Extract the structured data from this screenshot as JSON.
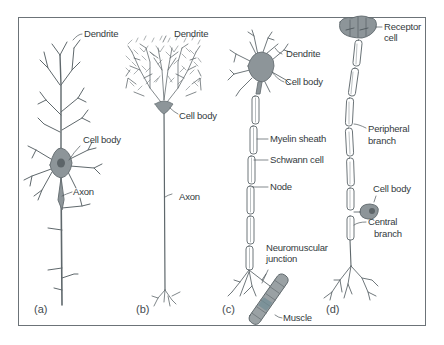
{
  "figure": {
    "panels": [
      {
        "id": "a",
        "tag": "(a)",
        "labels": {
          "dendrite": "Dendrite",
          "cell_body": "Cell body",
          "axon": "Axon"
        }
      },
      {
        "id": "b",
        "tag": "(b)",
        "labels": {
          "dendrite": "Dendrite",
          "cell_body": "Cell body",
          "axon": "Axon"
        }
      },
      {
        "id": "c",
        "tag": "(c)",
        "labels": {
          "dendrite": "Dendrite",
          "cell_body": "Cell body",
          "myelin_sheath": "Myelin sheath",
          "schwann_cell": "Schwann cell",
          "node": "Node",
          "neuromuscular_junction_1": "Neuromuscular",
          "neuromuscular_junction_2": "junction",
          "muscle": "Muscle"
        }
      },
      {
        "id": "d",
        "tag": "(d)",
        "labels": {
          "receptor_cell_1": "Receptor",
          "receptor_cell_2": "cell",
          "peripheral_branch_1": "Peripheral",
          "peripheral_branch_2": "branch",
          "cell_body": "Cell body",
          "central_branch_1": "Central",
          "central_branch_2": "branch"
        }
      }
    ],
    "colors": {
      "frame": "#6c7378",
      "line": "#5f686c",
      "cell_fill": "#8d9599",
      "text": "#333a3d"
    }
  }
}
